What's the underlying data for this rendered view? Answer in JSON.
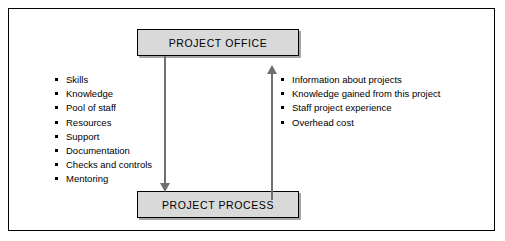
{
  "diagram": {
    "nodes": {
      "project_office": "PROJECT OFFICE",
      "project_process": "PROJECT PROCESS"
    },
    "inputs_to_process": [
      "Skills",
      "Knowledge",
      "Pool of staff",
      "Resources",
      "Support",
      "Documentation",
      "Checks and controls",
      "Mentoring"
    ],
    "outputs_to_office": [
      "Information about projects",
      "Knowledge gained from this project",
      "Staff project experience",
      "Overhead cost"
    ],
    "colors": {
      "box_fill": "#d9d9d9",
      "border": "#000000",
      "arrow": "#6f6f6f",
      "background": "#ffffff"
    }
  }
}
